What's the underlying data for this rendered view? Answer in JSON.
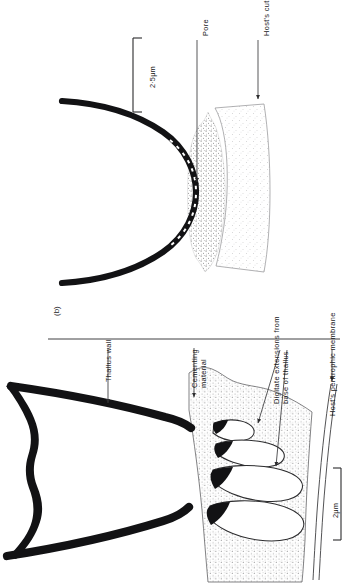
{
  "figure": {
    "panel_tag": "(b)",
    "orientation": "rotated-90",
    "background_color": "#ffffff",
    "ink_color": "#18181a"
  },
  "panel_top": {
    "name": "pore-region",
    "labels": {
      "pore": "Pore",
      "hosts_cuticle": "Host's cuticle"
    },
    "scale_bar": {
      "label": "2·5μm",
      "length_px": 78
    }
  },
  "panel_bottom": {
    "name": "thallus-base-region",
    "labels": {
      "thallus_wall": "Thallus wall",
      "cementing_material_line1": "Cementing",
      "cementing_material_line2": "material",
      "digitate_line1": "Digitate extensions from",
      "digitate_line2": "base of thallus",
      "hosts_peritrophic_membrane": "Host's peritrophic membrane"
    },
    "scale_bar": {
      "label": "2μm",
      "length_px": 72
    }
  },
  "colors": {
    "ink": "#18181a",
    "thallus_wall": "#111113",
    "cementing_stipple": "#4a4a4c",
    "cuticle_stipple": "#9a9a9c",
    "leader_line": "#3a3a3c",
    "divider": "#2b2b2d"
  }
}
